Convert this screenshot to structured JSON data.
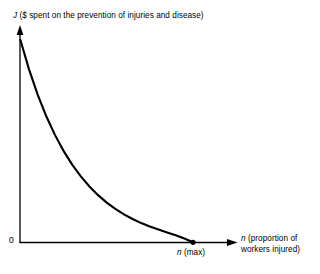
{
  "chart_data": {
    "type": "line",
    "title": "",
    "ylabel_symbol": "J",
    "ylabel_text": "($ spent on the prevention of injuries and disease)",
    "ylabel_full": "J ($ spent on the prevention of injuries and disease)",
    "xlabel_symbol": "n",
    "xlabel_text_line1": "(proportion of",
    "xlabel_text_line2": "workers injured)",
    "xlabel_full": "n (proportion of workers injured)",
    "origin_tick_label": "0",
    "x_end_symbol": "n",
    "x_end_text": "(max)",
    "x_end_label": "n (max)",
    "grid": false,
    "legend": false,
    "axis_arrows": true,
    "xlim": [
      0,
      1
    ],
    "ylim": [
      0,
      1
    ],
    "curve_description": "monotonically decreasing convex exponential decay from maximum J at n=0 to zero at n(max)",
    "series": [
      {
        "name": "J(n)",
        "color": "#000000",
        "x": [
          0.0,
          0.05,
          0.1,
          0.15,
          0.2,
          0.25,
          0.3,
          0.35,
          0.4,
          0.45,
          0.5,
          0.55,
          0.6,
          0.65,
          0.7,
          0.75,
          0.8,
          0.85,
          0.9,
          0.95,
          1.0
        ],
        "y": [
          1.0,
          0.855,
          0.73,
          0.623,
          0.531,
          0.452,
          0.384,
          0.326,
          0.276,
          0.233,
          0.196,
          0.165,
          0.138,
          0.115,
          0.095,
          0.078,
          0.063,
          0.049,
          0.035,
          0.019,
          0.0
        ]
      }
    ],
    "endpoint_marker": {
      "shape": "filled-circle",
      "x": 1.0,
      "y": 0.0,
      "color": "#000000"
    }
  },
  "figure": {
    "axis_color": "#000000",
    "curve_color": "#000000",
    "background": "#ffffff"
  }
}
